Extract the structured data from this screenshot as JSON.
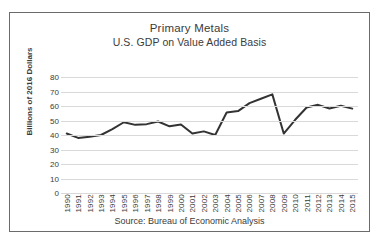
{
  "chart_data": {
    "type": "line",
    "title": "Primary Metals",
    "subtitle": "U.S. GDP on Value Added Basis",
    "xlabel": "",
    "ylabel": "Billions of 2016 Dollars",
    "source": "Source: Bureau of Economic Analysis",
    "ylim": [
      0,
      80
    ],
    "ytick_step": 10,
    "yticks": [
      80,
      70,
      60,
      50,
      40,
      30,
      20,
      10,
      0
    ],
    "grid": true,
    "legend": "none",
    "line_color": "#333333",
    "categories": [
      "1990",
      "1991",
      "1992",
      "1993",
      "1994",
      "1995",
      "1996",
      "1997",
      "1998",
      "1999",
      "2000",
      "2001",
      "2002",
      "2003",
      "2004",
      "2005",
      "2006",
      "2007",
      "2008",
      "2009",
      "2010",
      "2011",
      "2012",
      "2013",
      "2014",
      "2015"
    ],
    "values": [
      41.0,
      38.0,
      38.8,
      40.0,
      44.0,
      48.8,
      47.0,
      47.5,
      49.3,
      46.0,
      47.3,
      41.0,
      42.5,
      40.0,
      55.5,
      56.5,
      62.0,
      65.0,
      68.0,
      41.0,
      50.5,
      59.0,
      60.8,
      58.3,
      60.2,
      58.2
    ]
  }
}
